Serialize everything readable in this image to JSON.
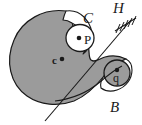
{
  "figure": {
    "type": "technical-line-diagram",
    "width": 142,
    "height": 125,
    "background_color": "#ffffff",
    "body_fill_color": "#9b9b9b",
    "outline_color": "#1a1a1a",
    "white_fill_color": "#ffffff"
  },
  "labels": {
    "curve_C": "C",
    "ground_H": "H",
    "point_P": "P",
    "center_c": "c",
    "point_q": "q",
    "curve_B": "B"
  },
  "points": [
    {
      "name": "P",
      "label": "P",
      "x": 79,
      "y": 38,
      "marker": "filled-dot"
    },
    {
      "name": "c",
      "label": "c",
      "x": 62,
      "y": 59,
      "marker": "filled-dot"
    },
    {
      "name": "q",
      "label": "q",
      "x": 117,
      "y": 71,
      "marker": "filled-dot"
    }
  ],
  "elements": {
    "main_body": "large shaded cam body with notch at upper right and tapering tail to lower right",
    "circle_P": "small circle around point P at upper right of body",
    "circle_q": "small circle around point q at lower right tail",
    "ground_hatch": "hatched fixed-ground symbol at upper right labeled H",
    "diagonal_line": "straight line from upper right near H down through body to lower left"
  }
}
